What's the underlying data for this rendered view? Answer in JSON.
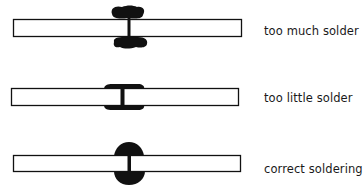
{
  "diagram": {
    "rows": [
      {
        "label": "too much solder",
        "type": "too-much"
      },
      {
        "label": "too little solder",
        "type": "too-little"
      },
      {
        "label": "correct soldering",
        "type": "correct"
      }
    ]
  },
  "colors": {
    "ink": "#111111",
    "background": "#ffffff"
  }
}
